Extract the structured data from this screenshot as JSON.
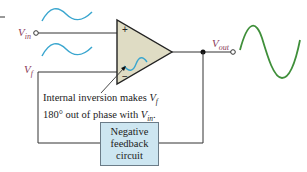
{
  "diagram": {
    "inputs": {
      "vin_label": "V",
      "vin_sub": "in",
      "vf_label": "V",
      "vf_sub": "f"
    },
    "output": {
      "vout_label": "V",
      "vout_sub": "out"
    },
    "opamp": {
      "plus_sign": "+",
      "minus_sign": "−"
    },
    "annotation": {
      "line1_text": "Internal inversion makes ",
      "line1_var": "V",
      "line1_sub": "f",
      "line2_text": "180° out of phase with ",
      "line2_var": "V",
      "line2_sub": "in",
      "line2_end": "."
    },
    "feedback_block": {
      "line1": "Negative",
      "line2": "feedback",
      "line3": "circuit"
    },
    "colors": {
      "opamp_fill": "#dfdcc4",
      "feedback_fill": "#cde6f1",
      "input_wave": "#3aa6cf",
      "output_wave": "#3f8f3a",
      "label_color": "#8a3a5a",
      "wire": "#333333"
    }
  }
}
